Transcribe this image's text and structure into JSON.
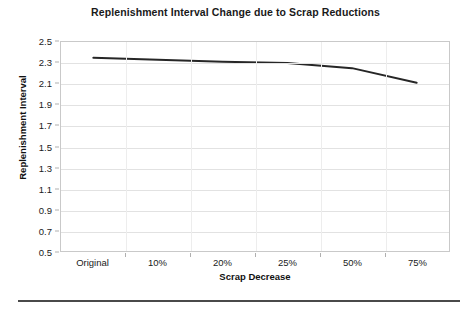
{
  "chart_data": {
    "type": "line",
    "title": "Replenishment Interval Change due to Scrap Reductions",
    "xlabel": "Scrap Decrease",
    "ylabel": "Replenishment Interval",
    "categories": [
      "Original",
      "10%",
      "20%",
      "25%",
      "50%",
      "75%"
    ],
    "values": [
      2.35,
      2.33,
      2.31,
      2.3,
      2.25,
      2.11
    ],
    "series": [
      {
        "name": "Replenishment Interval",
        "values": [
          2.35,
          2.33,
          2.31,
          2.3,
          2.25,
          2.11
        ],
        "color": "#262626",
        "line_width": 2
      }
    ],
    "ylim": [
      0.5,
      2.5
    ],
    "ytick_step": 0.2,
    "ytick_labels": [
      "2.5",
      "2.3",
      "2.1",
      "1.9",
      "1.7",
      "1.5",
      "1.3",
      "1.1",
      "0.9",
      "0.7",
      "0.5"
    ],
    "grid": true,
    "grid_axis": "y",
    "legend": false,
    "legend_position": "none",
    "markers": false,
    "plot_border_color": "#c9c9c9",
    "gridline_color": "#e2e2e2",
    "background_color": "#ffffff"
  },
  "footer": {
    "rule_color": "#4a4a4a"
  }
}
